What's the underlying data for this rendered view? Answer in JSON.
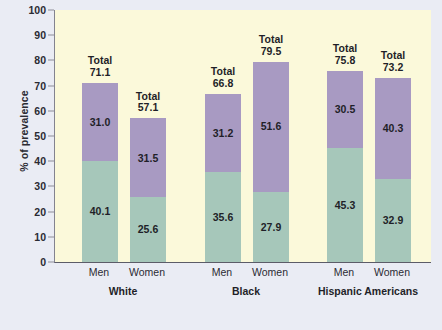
{
  "chart_data": {
    "type": "bar",
    "subtype": "stacked-grouped",
    "title": "",
    "xlabel": "",
    "ylabel": "% of prevalence",
    "ylim": [
      0,
      100
    ],
    "yticks": [
      0,
      10,
      20,
      30,
      40,
      50,
      60,
      70,
      80,
      90,
      100
    ],
    "ytick_labels": [
      "0",
      "10",
      "20",
      "30",
      "40",
      "50",
      "60",
      "70",
      "80",
      "90",
      "100"
    ],
    "grid": false,
    "legend": "none",
    "groups": [
      "White",
      "Black",
      "Hispanic Americans"
    ],
    "categories": [
      "Men",
      "Women",
      "Men",
      "Women",
      "Men",
      "Women"
    ],
    "series": [
      {
        "name": "lower-segment",
        "color": "#a6c7ba",
        "values": [
          40.1,
          25.6,
          35.6,
          27.9,
          45.3,
          32.9
        ]
      },
      {
        "name": "upper-segment",
        "color": "#a89ac2",
        "values": [
          31.0,
          31.5,
          31.2,
          51.6,
          30.5,
          40.3
        ]
      }
    ],
    "totals": [
      71.1,
      57.1,
      66.8,
      79.5,
      75.8,
      73.2
    ],
    "total_prefix": "Total",
    "bars": [
      {
        "group": "White",
        "category": "Men",
        "lower": "40.1",
        "upper": "31.0",
        "total": "71.1"
      },
      {
        "group": "White",
        "category": "Women",
        "lower": "25.6",
        "upper": "31.5",
        "total": "57.1"
      },
      {
        "group": "Black",
        "category": "Men",
        "lower": "35.6",
        "upper": "31.2",
        "total": "66.8"
      },
      {
        "group": "Black",
        "category": "Women",
        "lower": "27.9",
        "upper": "51.6",
        "total": "79.5"
      },
      {
        "group": "Hispanic Americans",
        "category": "Men",
        "lower": "45.3",
        "upper": "30.5",
        "total": "75.8"
      },
      {
        "group": "Hispanic Americans",
        "category": "Women",
        "lower": "32.9",
        "upper": "40.3",
        "total": "73.2"
      }
    ],
    "colors": {
      "plot_background": "#fbf9da",
      "page_background": "#eaecf4",
      "lower_segment": "#a6c7ba",
      "upper_segment": "#a89ac2",
      "axis": "#5c5c68",
      "text": "#1f1f28"
    }
  }
}
